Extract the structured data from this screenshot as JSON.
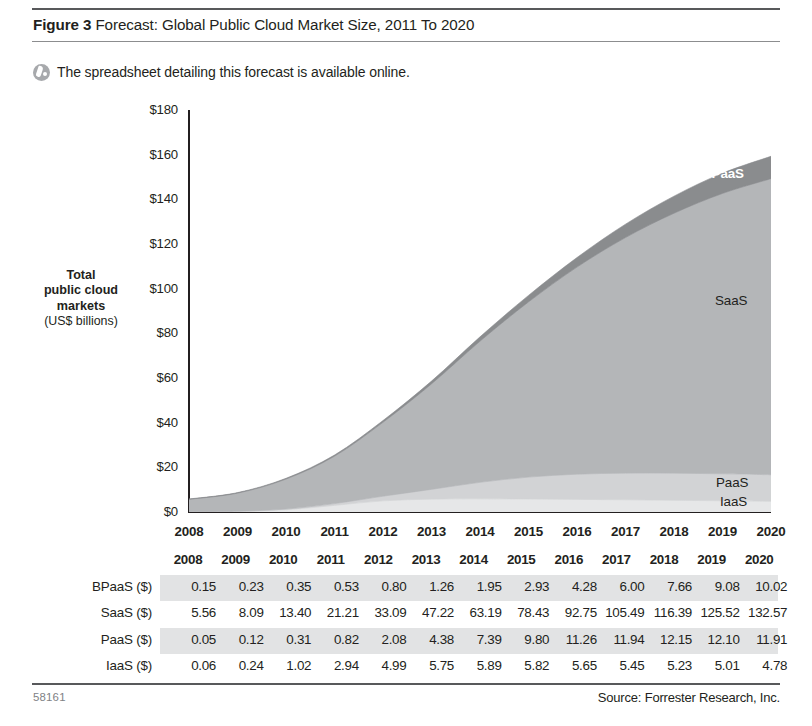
{
  "header": {
    "figure_label": "Figure 3",
    "title": " Forecast: Global Public Cloud Market Size, 2011 To 2020"
  },
  "note": {
    "icon": "spreadsheet-disc-icon",
    "text": "The spreadsheet detailing this forecast is available online."
  },
  "footer": {
    "folio": "58161",
    "source": "Source: Forrester Research, Inc."
  },
  "axis": {
    "y_title_line1": "Total",
    "y_title_line2": "public cloud",
    "y_title_line3": "markets",
    "y_units": "(US$ billions)",
    "y_ticks": [
      "$180",
      "$160",
      "$140",
      "$120",
      "$100",
      "$80",
      "$60",
      "$40",
      "$20",
      "$0"
    ]
  },
  "series_labels": {
    "bpaas": "BPaaS",
    "saas": "SaaS",
    "paas": "PaaS",
    "iaas": "IaaS"
  },
  "colors": {
    "bpaas": "#8a8c8e",
    "saas": "#b4b6b8",
    "paas": "#d2d3d5",
    "iaas": "#e6e7e8",
    "axis": "#231f20",
    "rule": "#58595b",
    "row_shade": "#e2e3e4"
  },
  "table": {
    "corner_label": "",
    "columns": [
      "2008",
      "2009",
      "2010",
      "2011",
      "2012",
      "2013",
      "2014",
      "2015",
      "2016",
      "2017",
      "2018",
      "2019",
      "2020"
    ],
    "rows": [
      {
        "label": "BPaaS ($)",
        "shaded": true,
        "values": [
          "0.15",
          "0.23",
          "0.35",
          "0.53",
          "0.80",
          "1.26",
          "1.95",
          "2.93",
          "4.28",
          "6.00",
          "7.66",
          "9.08",
          "10.02"
        ]
      },
      {
        "label": "SaaS ($)",
        "shaded": false,
        "values": [
          "5.56",
          "8.09",
          "13.40",
          "21.21",
          "33.09",
          "47.22",
          "63.19",
          "78.43",
          "92.75",
          "105.49",
          "116.39",
          "125.52",
          "132.57"
        ]
      },
      {
        "label": "PaaS ($)",
        "shaded": true,
        "values": [
          "0.05",
          "0.12",
          "0.31",
          "0.82",
          "2.08",
          "4.38",
          "7.39",
          "9.80",
          "11.26",
          "11.94",
          "12.15",
          "12.10",
          "11.91"
        ]
      },
      {
        "label": "IaaS ($)",
        "shaded": false,
        "values": [
          "0.06",
          "0.24",
          "1.02",
          "2.94",
          "4.99",
          "5.75",
          "5.89",
          "5.82",
          "5.65",
          "5.45",
          "5.23",
          "5.01",
          "4.78"
        ]
      }
    ]
  },
  "chart_data": {
    "type": "area",
    "title": "Forecast: Global Public Cloud Market Size, 2011 To 2020",
    "xlabel": "",
    "ylabel": "Total public cloud markets (US$ billions)",
    "stacked": true,
    "grid": false,
    "legend": "inline-right",
    "ylim": [
      0,
      180
    ],
    "yticks": [
      0,
      20,
      40,
      60,
      80,
      100,
      120,
      140,
      160,
      180
    ],
    "categories": [
      "2008",
      "2009",
      "2010",
      "2011",
      "2012",
      "2013",
      "2014",
      "2015",
      "2016",
      "2017",
      "2018",
      "2019",
      "2020"
    ],
    "stack_order_bottom_to_top": [
      "IaaS",
      "PaaS",
      "SaaS",
      "BPaaS"
    ],
    "series": [
      {
        "name": "IaaS",
        "color": "#e6e7e8",
        "values": [
          0.06,
          0.24,
          1.02,
          2.94,
          4.99,
          5.75,
          5.89,
          5.82,
          5.65,
          5.45,
          5.23,
          5.01,
          4.78
        ]
      },
      {
        "name": "PaaS",
        "color": "#d2d3d5",
        "values": [
          0.05,
          0.12,
          0.31,
          0.82,
          2.08,
          4.38,
          7.39,
          9.8,
          11.26,
          11.94,
          12.15,
          12.1,
          11.91
        ]
      },
      {
        "name": "SaaS",
        "color": "#b4b6b8",
        "values": [
          5.56,
          8.09,
          13.4,
          21.21,
          33.09,
          47.22,
          63.19,
          78.43,
          92.75,
          105.49,
          116.39,
          125.52,
          132.57
        ]
      },
      {
        "name": "BPaaS",
        "color": "#8a8c8e",
        "values": [
          0.15,
          0.23,
          0.35,
          0.53,
          0.8,
          1.26,
          1.95,
          2.93,
          4.28,
          6.0,
          7.66,
          9.08,
          10.02
        ]
      }
    ],
    "totals": [
      5.82,
      8.68,
      15.08,
      25.5,
      40.96,
      58.61,
      78.42,
      96.98,
      113.94,
      128.88,
      141.43,
      151.71,
      159.28
    ]
  }
}
